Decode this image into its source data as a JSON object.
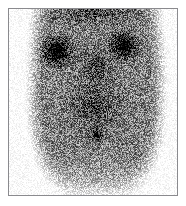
{
  "image": {
    "kind": "nuclear-medicine-scintigram",
    "modality_label": "Planar gamma camera scintigraphy",
    "orientation_label": "Anterior view",
    "colormap": "grayscale-inverted",
    "background_color": "#ffffff",
    "frame_color": "#8a8a8e",
    "frame": {
      "x": 8,
      "y": 8,
      "width": 170,
      "height": 188,
      "border_width": 1
    },
    "canvas": {
      "width": 168,
      "height": 186
    },
    "alt_text": "Grayscale nuclear medicine scintigram showing a body silhouette with two intense symmetric uptake foci in the upper field and a smaller midline focus below.",
    "has_text_annotations": false,
    "noise": {
      "type": "poisson-speckle",
      "grain_size_px": 1,
      "amplitude": 0.42,
      "seed": 20250417
    },
    "silhouette": {
      "description": "soft body outline, bright (low-count) margins left, right and inferior",
      "center_x": 0.52,
      "center_y": 0.46,
      "half_width": 0.44,
      "half_height": 0.62,
      "edge_softness": 0.3,
      "top_open": true
    },
    "background_activity": {
      "description": "diffuse low-level soft tissue uptake filling the torso",
      "intensity": 0.46
    },
    "hot_spots": [
      {
        "name": "upper-left-focus",
        "label": "Intense focal uptake, upper left field",
        "cx": 0.285,
        "cy": 0.225,
        "rx": 0.15,
        "ry": 0.13,
        "intensity": 1.0,
        "falloff": 1.9
      },
      {
        "name": "upper-right-focus",
        "label": "Intense focal uptake, upper right field",
        "cx": 0.685,
        "cy": 0.195,
        "rx": 0.135,
        "ry": 0.12,
        "intensity": 0.98,
        "falloff": 1.9
      },
      {
        "name": "midline-lower-focus",
        "label": "Smaller midline focal uptake, lower field",
        "cx": 0.518,
        "cy": 0.672,
        "rx": 0.072,
        "ry": 0.062,
        "intensity": 0.78,
        "falloff": 2.2
      },
      {
        "name": "upper-midline-band",
        "label": "Mid-grade uptake band across the upper midline",
        "cx": 0.515,
        "cy": 0.3,
        "rx": 0.2,
        "ry": 0.2,
        "intensity": 0.34,
        "falloff": 2.4
      },
      {
        "name": "central-torso-haze",
        "label": "Broad central torso activity",
        "cx": 0.505,
        "cy": 0.52,
        "rx": 0.3,
        "ry": 0.27,
        "intensity": 0.33,
        "falloff": 2.1
      },
      {
        "name": "superior-band",
        "label": "Activity band along the superior margin",
        "cx": 0.5,
        "cy": 0.02,
        "rx": 0.46,
        "ry": 0.13,
        "intensity": 0.3,
        "falloff": 2.0
      }
    ],
    "cold_regions": [
      {
        "name": "inferior-washout",
        "label": "Low-count inferior field",
        "cx": 0.5,
        "cy": 1.08,
        "rx": 0.62,
        "ry": 0.33,
        "strength": 0.95
      },
      {
        "name": "left-margin-washout",
        "label": "Low-count left margin",
        "cx": -0.055,
        "cy": 0.64,
        "rx": 0.23,
        "ry": 0.52,
        "strength": 0.85
      },
      {
        "name": "right-margin-washout",
        "label": "Low-count right margin",
        "cx": 1.06,
        "cy": 0.6,
        "rx": 0.23,
        "ry": 0.54,
        "strength": 0.85
      }
    ]
  }
}
